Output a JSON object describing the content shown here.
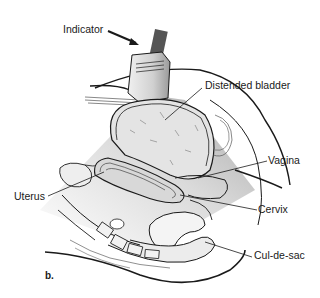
{
  "figure": {
    "panel_label": "b.",
    "labels": {
      "indicator": "Indicator",
      "distended_bladder": "Distended bladder",
      "vagina": "Vagina",
      "uterus": "Uterus",
      "cervix": "Cervix",
      "cul_de_sac": "Cul-de-sac"
    },
    "colors": {
      "line": "#1a1a1a",
      "beam_light": "#f2f2f2",
      "beam_dark": "#a8a8a8",
      "probe": "#d9d9d9"
    }
  }
}
